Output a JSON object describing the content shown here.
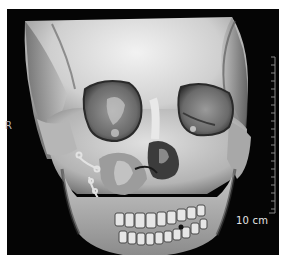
{
  "image": {
    "description": "3D CT volume rendering of a skull, frontal view, showing fractured right maxilla/nasal region with fixation plates",
    "orientation_label": "R",
    "scale_bar": {
      "label": "10 cm",
      "major_ticks": 20,
      "color": "#9a9a9a"
    },
    "colors": {
      "background": "#050505",
      "bone_light": "#e4e4e4",
      "bone_mid": "#b0b0b0",
      "bone_dark": "#5a5a5a",
      "label": "#e6e6e6"
    }
  }
}
